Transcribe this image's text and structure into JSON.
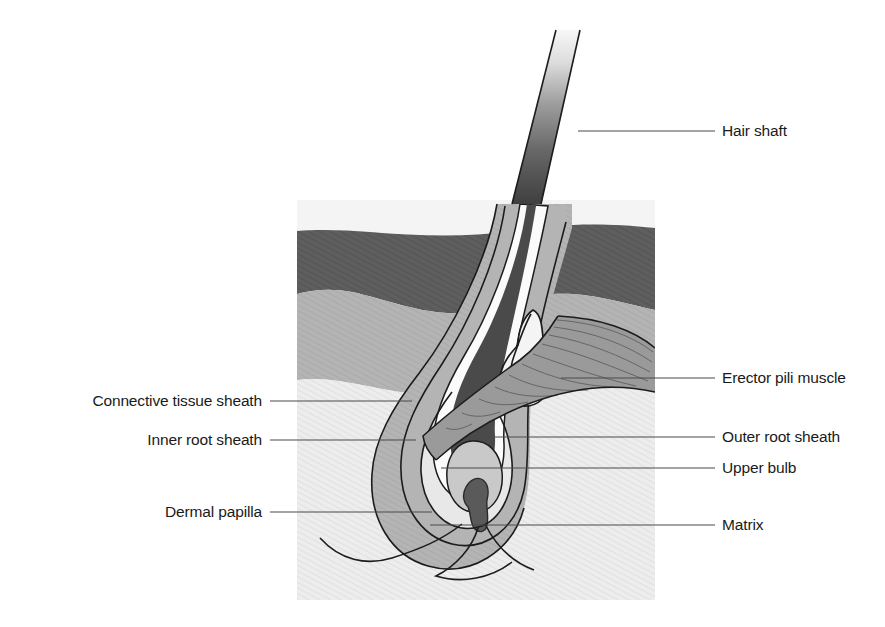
{
  "figure": {
    "background_color": "#ffffff",
    "illustration_block": {
      "x": 297,
      "y": 200,
      "width": 358,
      "height": 400,
      "fill": "#f2f2f2",
      "note": "pale hatched dermis/hypodermis block"
    },
    "palette": {
      "stratum_corneum": "#f0f0f0",
      "epidermis": "#5e5e5e",
      "dermis": "#b4b4b4",
      "hypodermis": "#ededed",
      "hair_shaft_top": "#f5f5f5",
      "hair_shaft_bottom": "#3c3c3c",
      "hair_root": "#4a4a4a",
      "inner_root_sheath": "#fbfbfb",
      "outer_root_sheath": "#b4b4b4",
      "upper_bulb": "#e8e8e8",
      "matrix": "#c9c9c9",
      "dermal_papilla": "#5a5a5a",
      "sebaceous_gland": "#f4f4f4",
      "erector_pili_muscle": "#9a9a9a",
      "outline": "#1c1c1c",
      "leader_line": "#4a4a4a",
      "label_text": "#1a1a1a"
    }
  },
  "labels": {
    "left": [
      {
        "id": "connective-tissue-sheath",
        "text": "Connective tissue sheath",
        "text_x": 262,
        "text_y": 406,
        "leader": {
          "x1": 270,
          "y1": 401,
          "x2": 412,
          "y2": 401
        }
      },
      {
        "id": "inner-root-sheath",
        "text": "Inner root sheath",
        "text_x": 262,
        "text_y": 445,
        "leader": {
          "x1": 270,
          "y1": 440,
          "x2": 416,
          "y2": 440
        }
      },
      {
        "id": "dermal-papilla",
        "text": "Dermal papilla",
        "text_x": 262,
        "text_y": 517,
        "leader": {
          "x1": 270,
          "y1": 512,
          "x2": 432,
          "y2": 512
        }
      }
    ],
    "right": [
      {
        "id": "hair-shaft",
        "text": "Hair shaft",
        "text_x": 722,
        "text_y": 136,
        "leader": {
          "x1": 578,
          "y1": 131,
          "x2": 715,
          "y2": 131
        }
      },
      {
        "id": "erector-pili-muscle",
        "text": "Erector pili muscle",
        "text_x": 722,
        "text_y": 383,
        "leader": {
          "x1": 561,
          "y1": 378,
          "x2": 715,
          "y2": 378
        }
      },
      {
        "id": "outer-root-sheath",
        "text": "Outer root sheath",
        "text_x": 722,
        "text_y": 442,
        "leader": {
          "x1": 474,
          "y1": 437,
          "x2": 715,
          "y2": 437
        }
      },
      {
        "id": "upper-bulb",
        "text": "Upper bulb",
        "text_x": 722,
        "text_y": 473,
        "leader": {
          "x1": 441,
          "y1": 468,
          "x2": 715,
          "y2": 468
        }
      },
      {
        "id": "matrix",
        "text": "Matrix",
        "text_x": 722,
        "text_y": 530,
        "leader": {
          "x1": 430,
          "y1": 525,
          "x2": 715,
          "y2": 525
        }
      }
    ]
  }
}
